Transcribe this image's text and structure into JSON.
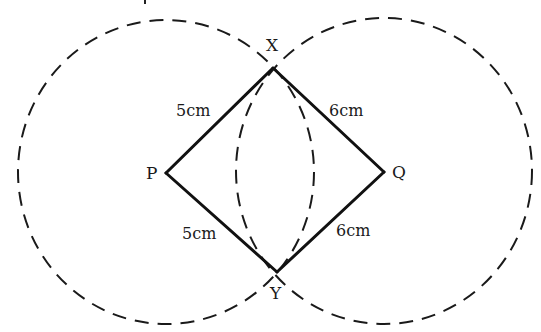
{
  "diagram": {
    "type": "geometric-construction",
    "points": {
      "P": {
        "label": "P",
        "x": 166,
        "y": 173
      },
      "Q": {
        "label": "Q",
        "x": 384,
        "y": 172
      },
      "X": {
        "label": "X",
        "x": 273,
        "y": 68
      },
      "Y": {
        "label": "Y",
        "x": 277,
        "y": 272
      }
    },
    "segments": [
      {
        "from": "P",
        "to": "X",
        "length_label": "5cm"
      },
      {
        "from": "X",
        "to": "Q",
        "length_label": "6cm"
      },
      {
        "from": "P",
        "to": "Y",
        "length_label": "5cm"
      },
      {
        "from": "Y",
        "to": "Q",
        "length_label": "6cm"
      }
    ],
    "circles": [
      {
        "center": "P",
        "style": "dashed",
        "radius_px": 150
      },
      {
        "center": "Q",
        "style": "dashed",
        "radius_px": 150
      }
    ],
    "stroke_color": "#1a1a1a"
  }
}
